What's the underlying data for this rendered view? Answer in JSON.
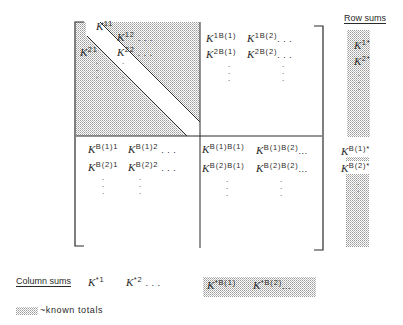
{
  "diagram": {
    "type": "block matrix with marginal sums",
    "colors": {
      "ink": "#2a2a2a",
      "shade": "#b8b8b8",
      "background": "#ffffff"
    },
    "matrix": {
      "top_left_block": {
        "shaded": true,
        "unshaded_diagonal_band": true,
        "entries": [
          {
            "base": "K",
            "sup": "11"
          },
          {
            "base": "K",
            "sup": "12",
            "suffix": ". . ."
          },
          {
            "base": "K",
            "sup": "21"
          },
          {
            "base": "K",
            "sup": "22",
            "suffix": ". . ."
          }
        ],
        "vdots": ":"
      },
      "top_right_block": {
        "entries": [
          {
            "base": "K",
            "sup": "1B(1)"
          },
          {
            "base": "K",
            "sup": "1B(2)",
            "suffix": ". . ."
          },
          {
            "base": "K",
            "sup": "2B(1)"
          },
          {
            "base": "K",
            "sup": "2B(2)",
            "suffix": ". . ."
          }
        ],
        "vdots": ":"
      },
      "bottom_left_block": {
        "entries": [
          {
            "base": "K",
            "sup": "B(1)1"
          },
          {
            "base": "K",
            "sup": "B(1)2",
            "suffix": ". . ."
          },
          {
            "base": "K",
            "sup": "B(2)1"
          },
          {
            "base": "K",
            "sup": "B(2)2",
            "suffix": ". . ."
          }
        ],
        "vdots": ":"
      },
      "bottom_right_block": {
        "entries": [
          {
            "base": "K",
            "sup": "B(1)B(1)"
          },
          {
            "base": "K",
            "sup": "B(1)B(2)",
            "suffix": "..."
          },
          {
            "base": "K",
            "sup": "B(2)B(1)"
          },
          {
            "base": "K",
            "sup": "B(2)B(2)",
            "suffix": "..."
          }
        ],
        "vdots": ":"
      }
    },
    "row_sums": {
      "title": "Row sums",
      "entries": [
        {
          "base": "K",
          "sup": "1*"
        },
        {
          "base": "K",
          "sup": "2*"
        },
        {
          "base": "K",
          "sup": "B(1)*"
        },
        {
          "base": "K",
          "sup": "B(2)*"
        }
      ]
    },
    "column_sums": {
      "title": "Column sums",
      "entries": [
        {
          "base": "K",
          "sup": "*1"
        },
        {
          "base": "K",
          "sup": "*2",
          "suffix": ". . ."
        },
        {
          "base": "K",
          "sup": "*B(1)"
        },
        {
          "base": "K",
          "sup": "*B(2)",
          "suffix": "..."
        }
      ]
    },
    "legend": {
      "text": "~known totals"
    }
  }
}
